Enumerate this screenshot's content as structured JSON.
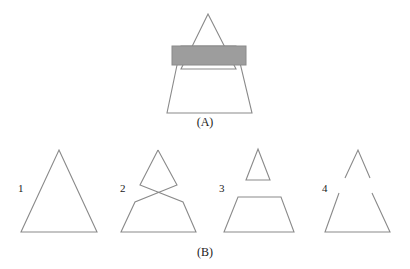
{
  "figure": {
    "stroke_color": "#8a8a8a",
    "fill_color": "#9d9d9d",
    "background_color": "#ffffff",
    "caption_a": "(A)",
    "caption_b": "(B)",
    "panel_a": {
      "name": "composite-shape-with-bar",
      "top_triangle": {
        "apex": [
          208,
          14
        ],
        "left_base": [
          181,
          69
        ],
        "right_base": [
          236,
          69
        ]
      },
      "bottom_trapezoid": {
        "top_left": [
          181,
          46
        ],
        "top_right": [
          236,
          46
        ],
        "bottom_right": [
          252,
          113
        ],
        "bottom_left": [
          167,
          113
        ]
      },
      "bar_rect": {
        "x": 172,
        "y": 46,
        "width": 74,
        "height": 19
      }
    },
    "panel_b": {
      "options": [
        {
          "label": "1",
          "name": "option-1-large-triangle",
          "polygons": [
            [
              [
                59,
                150
              ],
              [
                97,
                232
              ],
              [
                21,
                232
              ]
            ]
          ],
          "polylines": []
        },
        {
          "label": "2",
          "name": "option-2-crossed-bowtie",
          "polygons": [],
          "polylines": [
            [
              [
                158,
                150
              ],
              [
                140,
                185
              ],
              [
                183,
                202
              ],
              [
                196,
                232
              ],
              [
                121,
                232
              ],
              [
                135,
                202
              ],
              [
                177,
                185
              ],
              [
                158,
                150
              ]
            ]
          ]
        },
        {
          "label": "3",
          "name": "option-3-triangle-and-trapezoid",
          "polygons": [
            [
              [
                258,
                149
              ],
              [
                270,
                180
              ],
              [
                246,
                180
              ]
            ],
            [
              [
                238,
                197
              ],
              [
                281,
                197
              ],
              [
                294,
                232
              ],
              [
                224,
                232
              ]
            ]
          ],
          "polylines": []
        },
        {
          "label": "4",
          "name": "option-4-chevron-and-open-triangle",
          "polygons": [],
          "polylines": [
            [
              [
                345,
                178
              ],
              [
                358,
                150
              ],
              [
                370,
                178
              ]
            ],
            [
              [
                339,
                193
              ],
              [
                325,
                232
              ],
              [
                390,
                232
              ],
              [
                372,
                193
              ]
            ]
          ]
        }
      ]
    }
  }
}
